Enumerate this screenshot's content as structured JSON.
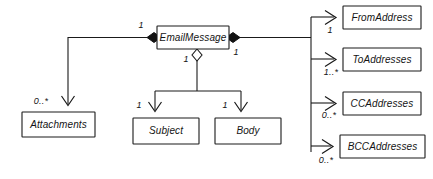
{
  "diagram": {
    "type": "uml-class-diagram",
    "root_class": {
      "id": "email-message",
      "name": "EmailMessage",
      "box": {
        "x": 157,
        "y": 26,
        "w": 72,
        "h": 23
      }
    },
    "classes": [
      {
        "id": "attachments",
        "name": "Attachments",
        "box": {
          "x": 22,
          "y": 112,
          "w": 73,
          "h": 25
        }
      },
      {
        "id": "subject",
        "name": "Subject",
        "box": {
          "x": 133,
          "y": 118,
          "w": 66,
          "h": 26
        }
      },
      {
        "id": "body",
        "name": "Body",
        "box": {
          "x": 215,
          "y": 118,
          "w": 66,
          "h": 26
        }
      },
      {
        "id": "from-address",
        "name": "FromAddress",
        "box": {
          "x": 343,
          "y": 6,
          "w": 78,
          "h": 23
        }
      },
      {
        "id": "to-addresses",
        "name": "ToAddresses",
        "box": {
          "x": 343,
          "y": 48,
          "w": 78,
          "h": 23
        }
      },
      {
        "id": "cc-addresses",
        "name": "CCAddresses",
        "box": {
          "x": 343,
          "y": 92,
          "w": 78,
          "h": 23
        }
      },
      {
        "id": "bcc-addresses",
        "name": "BCCAddresses",
        "box": {
          "x": 340,
          "y": 135,
          "w": 85,
          "h": 23
        }
      }
    ],
    "relationships": [
      {
        "id": "rel-attachments",
        "from": "email-message",
        "to": "attachments",
        "kind": "composition",
        "adornment": "filled-diamond",
        "arrowhead": "open",
        "source_multiplicity": "1",
        "target_multiplicity": "0..*"
      },
      {
        "id": "rel-subject",
        "from": "email-message",
        "to": "subject",
        "kind": "aggregation",
        "adornment": "hollow-diamond",
        "arrowhead": "open",
        "source_multiplicity": "1",
        "target_multiplicity": "1"
      },
      {
        "id": "rel-body",
        "from": "email-message",
        "to": "body",
        "kind": "aggregation",
        "adornment": "hollow-diamond",
        "arrowhead": "open",
        "source_multiplicity": "1",
        "target_multiplicity": "1"
      },
      {
        "id": "rel-from-address",
        "from": "email-message",
        "to": "from-address",
        "kind": "composition",
        "adornment": "filled-diamond",
        "arrowhead": "open",
        "source_multiplicity": "1",
        "target_multiplicity": "1"
      },
      {
        "id": "rel-to-addresses",
        "from": "email-message",
        "to": "to-addresses",
        "kind": "composition",
        "adornment": "filled-diamond",
        "arrowhead": "open",
        "source_multiplicity": "1",
        "target_multiplicity": "1..*"
      },
      {
        "id": "rel-cc-addresses",
        "from": "email-message",
        "to": "cc-addresses",
        "kind": "composition",
        "adornment": "filled-diamond",
        "arrowhead": "open",
        "source_multiplicity": "1",
        "target_multiplicity": "0..*"
      },
      {
        "id": "rel-bcc-addresses",
        "from": "email-message",
        "to": "bcc-addresses",
        "kind": "composition",
        "adornment": "filled-diamond",
        "arrowhead": "open",
        "source_multiplicity": "1",
        "target_multiplicity": "0..*"
      }
    ],
    "multiplicity_labels": {
      "left_diamond": "1",
      "right_diamond": "1",
      "bottom_diamond": "1",
      "attachments_end": "0..*",
      "subject_end": "1",
      "body_end": "1",
      "from_address_end": "1",
      "to_addresses_end": "1..*",
      "cc_addresses_end": "0..*",
      "bcc_addresses_end": "0..*"
    },
    "colors": {
      "stroke": "#1a1a1a",
      "fill": "#ffffff",
      "text": "#141414",
      "diamond_filled": "#121212"
    }
  }
}
